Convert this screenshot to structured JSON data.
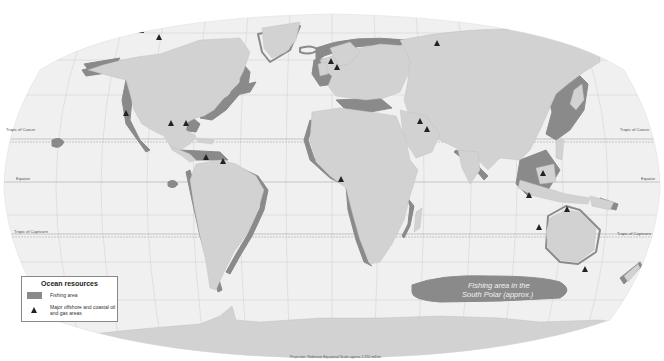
{
  "map": {
    "title": "Ocean resources",
    "colors": {
      "background": "#ffffff",
      "ocean": "#f0f0f0",
      "land": "#d2d2d2",
      "fishing_area": "#8a8a8a",
      "graticule": "#c8c8c8",
      "oil_gas_marker": "#222222"
    },
    "latitude_lines": [
      {
        "label": "Tropic of Cancer"
      },
      {
        "label": "Equator"
      },
      {
        "label": "Tropic of Capricorn"
      }
    ],
    "annotation": {
      "line1": "Fishing area in the",
      "line2": "South Polar (approx.)"
    },
    "footer": "Projection: Robinson   Equatorial Scale approx 1:250 million"
  },
  "legend": {
    "title": "Ocean resources",
    "items": [
      {
        "symbol": "fishing-area-swatch",
        "label": "Fishing area"
      },
      {
        "symbol": "oil-gas-triangle-icon",
        "label": "Major offshore and coastal oil and gas areas"
      }
    ]
  }
}
